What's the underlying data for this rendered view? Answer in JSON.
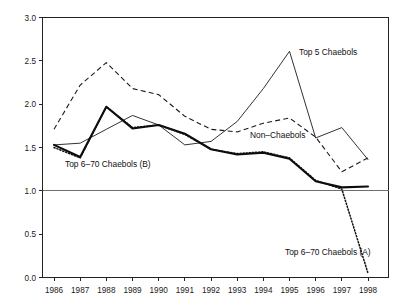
{
  "chart_data": {
    "type": "line",
    "title": "",
    "subtitle": "",
    "xlabel": "",
    "ylabel": "",
    "grid": false,
    "legend_position": "inline-annotations",
    "categories": [
      "1986",
      "1987",
      "1988",
      "1989",
      "1990",
      "1991",
      "1992",
      "1993",
      "1994",
      "1995",
      "1996",
      "1997",
      "1998"
    ],
    "x": [
      1986,
      1987,
      1988,
      1989,
      1990,
      1991,
      1992,
      1993,
      1994,
      1995,
      1996,
      1997,
      1998
    ],
    "xlim": [
      1986,
      1998
    ],
    "ylim": [
      0.0,
      3.0
    ],
    "y_ticks": [
      "0.0",
      "0.5",
      "1.0",
      "1.5",
      "2.0",
      "2.5",
      "3.0"
    ],
    "y_tick_values": [
      0.0,
      0.5,
      1.0,
      1.5,
      2.0,
      2.5,
      3.0
    ],
    "reference_lines": [
      {
        "name": "unity-line",
        "y": 1.0,
        "color": "#6e6e6e"
      }
    ],
    "series": [
      {
        "name": "Top 5 Chaebols",
        "style": "solid-thin",
        "color": "#1b1b1b",
        "values": [
          1.53,
          1.55,
          1.71,
          1.87,
          1.76,
          1.53,
          1.57,
          1.8,
          2.18,
          2.61,
          1.61,
          1.73,
          1.36
        ]
      },
      {
        "name": "Non–Chaebols",
        "style": "dashed",
        "color": "#1b1b1b",
        "values": [
          1.71,
          2.22,
          2.48,
          2.18,
          2.11,
          1.86,
          1.71,
          1.68,
          1.78,
          1.84,
          1.62,
          1.22,
          1.38
        ]
      },
      {
        "name": "Top 6–70 Chaebols (B)",
        "style": "solid-thick",
        "color": "#0c0c0c",
        "values": [
          1.53,
          1.39,
          1.97,
          1.72,
          1.76,
          1.66,
          1.48,
          1.42,
          1.44,
          1.37,
          1.11,
          1.04,
          1.05
        ]
      },
      {
        "name": "Top 6–70 Chaebols (A)",
        "style": "dotted",
        "color": "#101010",
        "values": [
          1.5,
          1.38,
          1.97,
          1.73,
          1.76,
          1.65,
          1.48,
          1.43,
          1.45,
          1.38,
          1.12,
          1.02,
          0.05
        ]
      }
    ],
    "annotations": [
      {
        "name": "top5-label",
        "text": "Top 5 Chaebols",
        "x_px": 299,
        "y_px": 55
      },
      {
        "name": "nonchaebols-label",
        "text": "Non–Chaebols",
        "x_px": 250,
        "y_px": 138
      },
      {
        "name": "top670b-label",
        "text": "Top 6–70 Chaebols (B)",
        "x_px": 65,
        "y_px": 167
      },
      {
        "name": "top670a-label",
        "text": "Top 6–70 Chaebols (A)",
        "x_px": 285,
        "y_px": 255
      }
    ]
  }
}
